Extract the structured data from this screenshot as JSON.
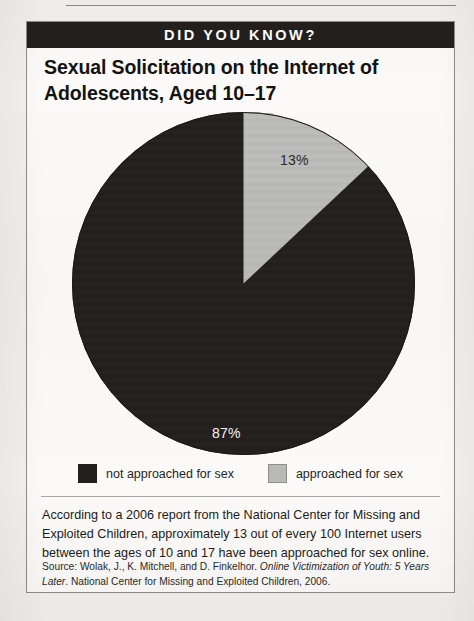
{
  "banner": {
    "label": "DID YOU KNOW?"
  },
  "figure": {
    "title": "Sexual Solicitation on the Internet of Adolescents, Aged 10–17"
  },
  "chart_data": {
    "type": "pie",
    "title": "Sexual Solicitation on the Internet of Adolescents, Aged 10–17",
    "categories": [
      "not approached for sex",
      "approached for sex"
    ],
    "values": [
      87,
      13
    ],
    "unit": "%",
    "data_labels": [
      "87%",
      "13%"
    ],
    "colors": [
      "#231f1d",
      "#bcbcba"
    ],
    "legend_position": "bottom",
    "start_angle_deg": 0,
    "direction": "clockwise",
    "grid": false
  },
  "legend": {
    "items": [
      {
        "label": "not approached for sex",
        "color": "#231f1d"
      },
      {
        "label": "approached for sex",
        "color": "#b9b9b7"
      }
    ]
  },
  "labels": {
    "gray_slice": "13%",
    "dark_slice": "87%"
  },
  "body": {
    "text": "According to a 2006 report from the National Center for Missing and Exploited Children, approximately 13 out of every 100 Internet users between the ages of 10 and 17 have been approached for sex online."
  },
  "source": {
    "prefix": "Source: Wolak, J., K. Mitchell, and D. Finkelhor. ",
    "italic_title": "Online Victimization of Youth: 5 Years Later",
    "suffix": ". National Center for Missing and Exploited Children, 2006."
  }
}
